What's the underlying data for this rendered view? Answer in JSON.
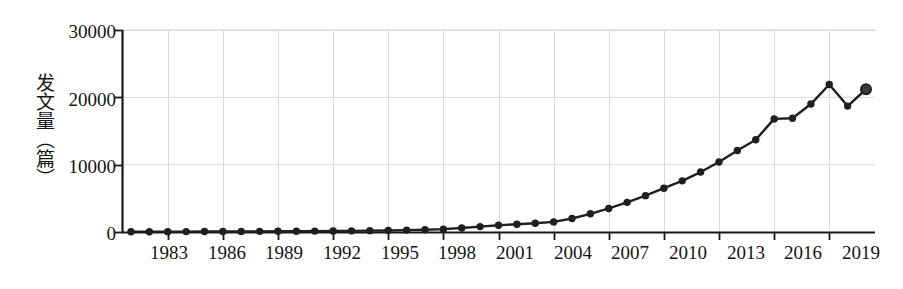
{
  "chart_data": {
    "type": "line",
    "title": "",
    "xlabel": "",
    "ylabel": "发文量（篇）",
    "ylim": [
      0,
      30000
    ],
    "xlim": [
      1981,
      2021
    ],
    "grid": true,
    "legend": "none",
    "y_ticks": [
      "0",
      "10000",
      "20000",
      "30000"
    ],
    "y_tick_values": [
      0,
      10000,
      20000,
      30000
    ],
    "x_ticks": [
      "1983",
      "1986",
      "1989",
      "1992",
      "1995",
      "1998",
      "2001",
      "2004",
      "2007",
      "2010",
      "2013",
      "2016",
      "2019"
    ],
    "x_tick_values": [
      1983,
      1986,
      1989,
      1992,
      1995,
      1998,
      2001,
      2004,
      2007,
      2010,
      2013,
      2016,
      2019
    ],
    "marker": "filled-circle",
    "line_color": "#1f1f1f",
    "marker_color": "#1f1f1f",
    "grid_color": "#d9d9d9",
    "axis_color": "#1a1a1a",
    "x": [
      1981,
      1982,
      1983,
      1984,
      1985,
      1986,
      1987,
      1988,
      1989,
      1990,
      1991,
      1992,
      1993,
      1994,
      1995,
      1996,
      1997,
      1998,
      1999,
      2000,
      2001,
      2002,
      2003,
      2004,
      2005,
      2006,
      2007,
      2008,
      2009,
      2010,
      2011,
      2012,
      2013,
      2014,
      2015,
      2016,
      2017,
      2018,
      2019,
      2020,
      2021
    ],
    "values": [
      30,
      40,
      50,
      60,
      70,
      80,
      90,
      100,
      110,
      120,
      130,
      150,
      170,
      200,
      230,
      280,
      330,
      420,
      600,
      800,
      1000,
      1150,
      1300,
      1500,
      2000,
      2700,
      3500,
      4400,
      5400,
      6500,
      7600,
      8900,
      10400,
      12100,
      13700,
      16800,
      16900,
      19000,
      21900,
      18700,
      21200
    ],
    "series": [
      {
        "name": "发文量",
        "values": [
          30,
          40,
          50,
          60,
          70,
          80,
          90,
          100,
          110,
          120,
          130,
          150,
          170,
          200,
          230,
          280,
          330,
          420,
          600,
          800,
          1000,
          1150,
          1300,
          1500,
          2000,
          2700,
          3500,
          4400,
          5400,
          6500,
          7600,
          8900,
          10400,
          12100,
          13700,
          16800,
          16900,
          19000,
          21900,
          18700,
          21200
        ]
      }
    ]
  }
}
